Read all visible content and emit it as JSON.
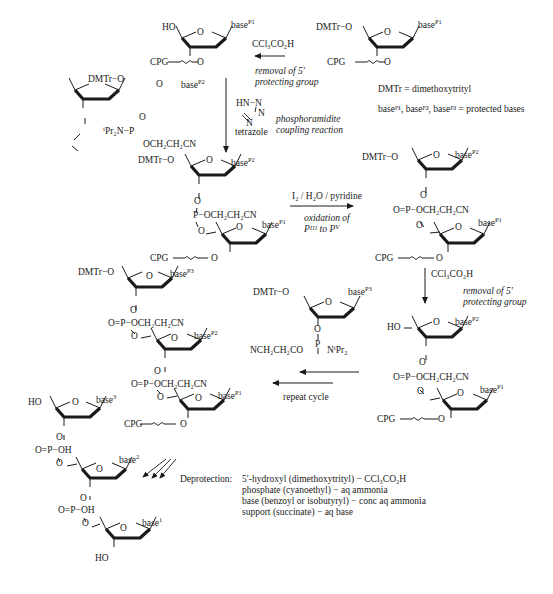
{
  "scheme": {
    "title": "Solid-phase phosphoramidite oligonucleotide synthesis cycle",
    "legend": {
      "dmtr_definition": "DMTr = dimethoxytrityl",
      "bases_definition": "baseᴾ¹, baseᴾ², baseᴾ³ = protected bases"
    },
    "step1": {
      "reagent": "CCl₃CO₂H",
      "description_line1": "removal of 5′",
      "description_line2": "protecting group"
    },
    "step2": {
      "activator_structure": "HN−N",
      "activator_name": "tetrazole",
      "description_line1": "phosphoramidite",
      "description_line2": "coupling reaction"
    },
    "step3": {
      "reagent": "I₂ / H₂O / pyridine",
      "description_line1": "oxidation of",
      "description_line2": "Pᴵᴵᴵ to Pⱽ"
    },
    "step4": {
      "reagent": "CCl₃CO₂H",
      "description_line1": "removal of 5′",
      "description_line2": "protecting group"
    },
    "step5": {
      "label": "repeat cycle"
    },
    "deprotection": {
      "heading": "Deprotection:",
      "lines": [
        "5′-hydroxyl (dimethoxytrityl) − CCl₃CO₂H",
        "phosphate (cyanoethyl) − aq ammonia",
        "base (benzoyl or isobutyryl) − conc aq ammonia",
        "support (succinate) − aq base"
      ]
    },
    "labels": {
      "HO": "HO",
      "DMTr_O": "DMTr−O",
      "O": "O",
      "CPG": "CPG",
      "P": "P",
      "OCH2CH2CN": "OCH₂CH₂CN",
      "iPr2N": "ⁱPr₂N",
      "NiPr2": "NⁱPr₂",
      "NCH2CH2CO": "NCH₂CH₂CO",
      "O_eq_P": "O=P",
      "OH": "OH",
      "base": "base",
      "p1": "P1",
      "p2": "P2",
      "p3": "P3",
      "n1": "1",
      "n2": "2",
      "n3": "3",
      "N": "N"
    }
  }
}
